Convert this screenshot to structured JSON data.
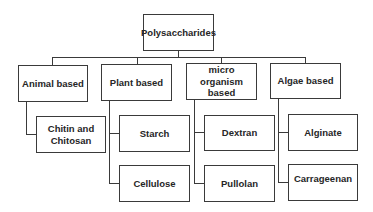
{
  "diagram": {
    "type": "tree",
    "root": {
      "label": "Polysaccharides"
    },
    "categories": [
      {
        "label": "Animal based",
        "children": [
          "Chitin and Chitosan"
        ]
      },
      {
        "label": "Plant based",
        "children": [
          "Starch",
          "Cellulose"
        ]
      },
      {
        "label": "micro organism based",
        "children": [
          "Dextran",
          "Pullolan"
        ]
      },
      {
        "label": "Algae based",
        "children": [
          "Alginate",
          "Carrageenan"
        ]
      }
    ]
  }
}
